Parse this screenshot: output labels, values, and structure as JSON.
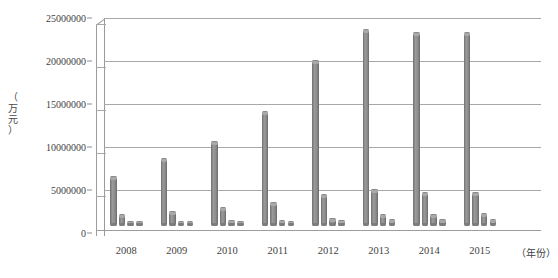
{
  "chart_data": {
    "type": "bar",
    "title": "",
    "subtitle": "",
    "xlabel": "（年份）",
    "ylabel": "（万元）",
    "ylabel_chars": [
      "（",
      "万",
      "元",
      "）"
    ],
    "categories": [
      "2008",
      "2009",
      "2010",
      "2011",
      "2012",
      "2013",
      "2014",
      "2015"
    ],
    "ylim": [
      0,
      25000000
    ],
    "ytick_values": [
      0,
      5000000,
      10000000,
      15000000,
      20000000,
      25000000
    ],
    "ytick_labels": [
      "0",
      "5000000",
      "10000000",
      "15000000",
      "20000000",
      "25000000"
    ],
    "grid": true,
    "legend": "",
    "legend_position": "none",
    "style": "3d-clustered-column",
    "series": [
      {
        "name": "series-1",
        "values": [
          5400000,
          7500000,
          9600000,
          13100000,
          19100000,
          22800000,
          22400000,
          22400000
        ]
      },
      {
        "name": "series-2",
        "values": [
          900000,
          1300000,
          1750000,
          2400000,
          3300000,
          3900000,
          3500000,
          3500000
        ]
      },
      {
        "name": "series-3",
        "values": [
          130000,
          170000,
          200000,
          260000,
          420000,
          900000,
          950000,
          1050000
        ]
      },
      {
        "name": "series-4",
        "values": [
          90000,
          110000,
          140000,
          170000,
          260000,
          300000,
          320000,
          350000
        ]
      }
    ],
    "colors": {
      "bar": "#8c8c8c",
      "gridline": "#a8a8a8",
      "axis": "#9d9d9d",
      "text": "#3f3f3f"
    }
  },
  "caption": {
    "text": ""
  }
}
